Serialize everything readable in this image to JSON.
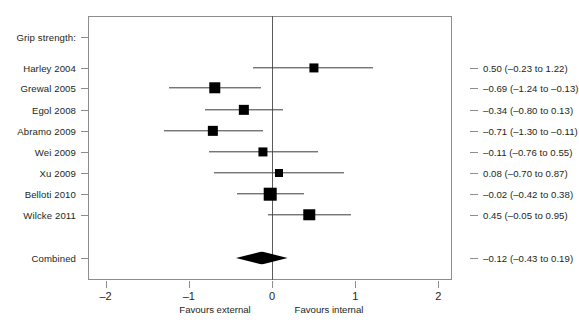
{
  "title": "",
  "chart_data": {
    "type": "forest",
    "title": "",
    "xlabel": "",
    "ylabel": "",
    "xlim": [
      -2,
      2
    ],
    "xticks": [
      -2,
      -1,
      0,
      1,
      2
    ],
    "xtick_labels": [
      "–2",
      "–1",
      "0",
      "1",
      "2"
    ],
    "grid": false,
    "null_line": 0,
    "left_axis_label": "Favours external",
    "right_axis_label": "Favours internal",
    "group_header": "Grip strength:",
    "effect_measure": "Mean difference (95% CI)",
    "rows": [
      {
        "label": "Grip strength:",
        "type": "header",
        "value_text": "",
        "estimate": null,
        "ci_low": null,
        "ci_high": null,
        "weight": 0
      },
      {
        "label": "Harley 2004",
        "type": "study",
        "value_text": "0.50 (–0.23 to 1.22)",
        "estimate": 0.5,
        "ci_low": -0.23,
        "ci_high": 1.22,
        "weight": 11
      },
      {
        "label": "Grewal 2005",
        "type": "study",
        "value_text": "–0.69 (–1.24 to –0.13)",
        "estimate": -0.69,
        "ci_low": -1.24,
        "ci_high": -0.13,
        "weight": 13
      },
      {
        "label": "Egol 2008",
        "type": "study",
        "value_text": "–0.34 (–0.80 to 0.13)",
        "estimate": -0.34,
        "ci_low": -0.8,
        "ci_high": 0.13,
        "weight": 12
      },
      {
        "label": "Abramo 2009",
        "type": "study",
        "value_text": "–0.71 (–1.30 to –0.11)",
        "estimate": -0.71,
        "ci_low": -1.3,
        "ci_high": -0.11,
        "weight": 12
      },
      {
        "label": "Wei 2009",
        "type": "study",
        "value_text": "–0.11 (–0.76 to 0.55)",
        "estimate": -0.11,
        "ci_low": -0.76,
        "ci_high": 0.55,
        "weight": 11
      },
      {
        "label": "Xu 2009",
        "type": "study",
        "value_text": "0.08 (–0.70 to 0.87)",
        "estimate": 0.08,
        "ci_low": -0.7,
        "ci_high": 0.87,
        "weight": 10
      },
      {
        "label": "Belloti 2010",
        "type": "study",
        "value_text": "–0.02 (–0.42 to 0.38)",
        "estimate": -0.02,
        "ci_low": -0.42,
        "ci_high": 0.38,
        "weight": 14
      },
      {
        "label": "Wilcke 2011",
        "type": "study",
        "value_text": "0.45 (–0.05 to 0.95)",
        "estimate": 0.45,
        "ci_low": -0.05,
        "ci_high": 0.95,
        "weight": 13
      },
      {
        "label": "Combined",
        "type": "summary",
        "value_text": "–0.12 (–0.43 to 0.19)",
        "estimate": -0.12,
        "ci_low": -0.43,
        "ci_high": 0.19,
        "weight": 0
      }
    ]
  },
  "colors": {
    "marker": "#000000",
    "line": "#3b3b3b",
    "axis": "#8d8d8d",
    "text": "#231f20",
    "background": "#ffffff"
  }
}
